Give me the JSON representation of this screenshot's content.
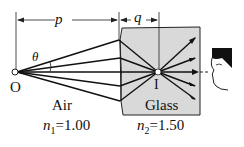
{
  "diagram": {
    "labels": {
      "p": "p",
      "q": "q",
      "theta": "θ",
      "object": "O",
      "image": "I",
      "medium1": "Air",
      "medium2": "Glass",
      "n1_sym": "n",
      "n1_sub": "1",
      "n1_val": "=1.00",
      "n2_sym": "n",
      "n2_sub": "2",
      "n2_val": "=1.50"
    },
    "colors": {
      "glass": "#d9d9d9",
      "ink": "#111111",
      "hair": "#1a1a1a"
    }
  }
}
